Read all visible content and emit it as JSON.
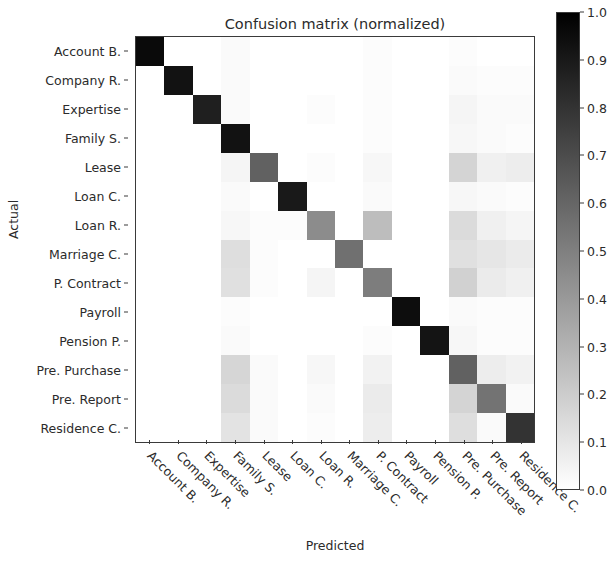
{
  "chart_data": {
    "type": "heatmap",
    "title": "Confusion matrix (normalized)",
    "xlabel": "Predicted",
    "ylabel": "Actual",
    "categories": [
      "Account B.",
      "Company R.",
      "Expertise",
      "Family S.",
      "Lease",
      "Loan C.",
      "Loan R.",
      "Marriage C.",
      "P. Contract",
      "Payroll",
      "Pension P.",
      "Pre. Purchase",
      "Pre. Report",
      "Residence C."
    ],
    "x_tick_labels": [
      "Account B.",
      "Company R.",
      "Expertise",
      "Family S.",
      "Lease",
      "Loan C.",
      "Loan R.",
      "Marriage C.",
      "P. Contract",
      "Payroll",
      "Pension P.",
      "Pre. Purchase",
      "Pre. Report",
      "Residence C."
    ],
    "y_tick_labels": [
      "Account B.",
      "Company R.",
      "Expertise",
      "Family S.",
      "Lease",
      "Loan C.",
      "Loan R.",
      "Marriage C.",
      "P. Contract",
      "Payroll",
      "Pension P.",
      "Pre. Purchase",
      "Pre. Report",
      "Residence C."
    ],
    "colormap": "greys",
    "colormap_low_color": "#ffffff",
    "colormap_high_color": "#000000",
    "zlim": [
      0.0,
      1.0
    ],
    "grid": false,
    "legend_position": "right-colorbar",
    "colorbar": {
      "ticks": [
        1.0,
        0.9,
        0.8,
        0.7,
        0.6,
        0.5,
        0.4,
        0.3,
        0.2,
        0.1,
        0.0
      ],
      "tick_labels": [
        "1.0",
        "0.9",
        "0.8",
        "0.7",
        "0.6",
        "0.5",
        "0.4",
        "0.3",
        "0.2",
        "0.1",
        "0.0"
      ],
      "orientation": "vertical"
    },
    "matrix": [
      [
        0.96,
        0.0,
        0.0,
        0.02,
        0.0,
        0.0,
        0.0,
        0.0,
        0.01,
        0.0,
        0.0,
        0.01,
        0.0,
        0.0
      ],
      [
        0.0,
        0.93,
        0.0,
        0.02,
        0.0,
        0.0,
        0.0,
        0.0,
        0.01,
        0.0,
        0.0,
        0.02,
        0.01,
        0.01
      ],
      [
        0.0,
        0.0,
        0.88,
        0.02,
        0.0,
        0.0,
        0.01,
        0.0,
        0.01,
        0.0,
        0.0,
        0.04,
        0.02,
        0.02
      ],
      [
        0.0,
        0.0,
        0.0,
        0.93,
        0.0,
        0.0,
        0.0,
        0.0,
        0.01,
        0.0,
        0.0,
        0.03,
        0.02,
        0.01
      ],
      [
        0.0,
        0.0,
        0.0,
        0.04,
        0.62,
        0.0,
        0.01,
        0.0,
        0.03,
        0.0,
        0.0,
        0.17,
        0.06,
        0.07
      ],
      [
        0.0,
        0.0,
        0.0,
        0.02,
        0.0,
        0.9,
        0.0,
        0.0,
        0.02,
        0.0,
        0.0,
        0.03,
        0.02,
        0.01
      ],
      [
        0.0,
        0.0,
        0.0,
        0.03,
        0.01,
        0.01,
        0.45,
        0.0,
        0.26,
        0.0,
        0.0,
        0.14,
        0.06,
        0.04
      ],
      [
        0.0,
        0.0,
        0.0,
        0.13,
        0.01,
        0.0,
        0.0,
        0.56,
        0.0,
        0.0,
        0.0,
        0.12,
        0.1,
        0.08
      ],
      [
        0.0,
        0.0,
        0.0,
        0.12,
        0.01,
        0.0,
        0.04,
        0.0,
        0.51,
        0.0,
        0.0,
        0.18,
        0.08,
        0.06
      ],
      [
        0.0,
        0.0,
        0.0,
        0.01,
        0.0,
        0.0,
        0.0,
        0.0,
        0.0,
        0.95,
        0.0,
        0.02,
        0.01,
        0.01
      ],
      [
        0.0,
        0.0,
        0.0,
        0.02,
        0.0,
        0.0,
        0.0,
        0.0,
        0.01,
        0.0,
        0.92,
        0.03,
        0.01,
        0.01
      ],
      [
        0.0,
        0.0,
        0.0,
        0.16,
        0.02,
        0.0,
        0.03,
        0.0,
        0.05,
        0.0,
        0.0,
        0.62,
        0.07,
        0.05
      ],
      [
        0.0,
        0.0,
        0.0,
        0.14,
        0.02,
        0.0,
        0.02,
        0.0,
        0.08,
        0.0,
        0.0,
        0.17,
        0.55,
        0.02
      ],
      [
        0.0,
        0.0,
        0.0,
        0.11,
        0.02,
        0.0,
        0.01,
        0.0,
        0.07,
        0.0,
        0.0,
        0.13,
        0.02,
        0.8
      ]
    ]
  }
}
